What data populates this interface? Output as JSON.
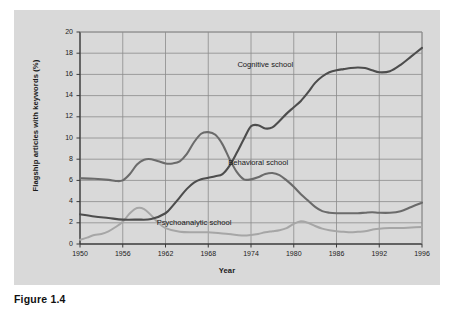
{
  "figure": {
    "caption": "Figure 1.4",
    "panel_bg": "#d9d9d9"
  },
  "chart_data": {
    "type": "line",
    "title": "",
    "xlabel": "Year",
    "ylabel": "Flagship articles with keywords (%)",
    "xlim": [
      1950,
      1996
    ],
    "ylim": [
      0,
      20
    ],
    "xticks": [
      1950,
      1956,
      1962,
      1968,
      1974,
      1980,
      1986,
      1992,
      1996
    ],
    "xtick_labels": [
      "1950",
      "1956",
      "1962",
      "1968",
      "1974",
      "1980",
      "1986",
      "1992",
      "1996"
    ],
    "yticks": [
      0,
      2,
      4,
      6,
      8,
      10,
      12,
      14,
      16,
      18,
      20
    ],
    "ytick_labels": [
      "0",
      "2",
      "4",
      "6",
      "8",
      "10",
      "12",
      "14",
      "16",
      "18",
      "20"
    ],
    "grid": true,
    "legend": "inline-annotations",
    "colors": {
      "cognitive": "#4d4d4d",
      "behavioral": "#6b6b6b",
      "psychoanalytic": "#a6a6a6",
      "axis": "#3a3a3a",
      "grid": "#8c8c8c"
    },
    "series": [
      {
        "name": "Cognitive school",
        "color": "#4d4d4d",
        "label_x": 1976,
        "label_y": 16.9,
        "x": [
          1950,
          1952,
          1954,
          1956,
          1958,
          1960,
          1962,
          1963,
          1964,
          1965,
          1966,
          1967,
          1968,
          1969,
          1970,
          1971,
          1972,
          1973,
          1974,
          1975,
          1976,
          1977,
          1978,
          1979,
          1980,
          1981,
          1982,
          1983,
          1984,
          1985,
          1986,
          1987,
          1988,
          1989,
          1990,
          1991,
          1992,
          1993,
          1994,
          1995,
          1996
        ],
        "y": [
          2.8,
          2.6,
          2.45,
          2.3,
          2.3,
          2.35,
          2.9,
          3.6,
          4.4,
          5.2,
          5.8,
          6.1,
          6.25,
          6.4,
          6.6,
          7.4,
          8.6,
          9.9,
          11.1,
          11.2,
          10.9,
          11.0,
          11.6,
          12.3,
          12.9,
          13.5,
          14.3,
          15.2,
          15.8,
          16.2,
          16.4,
          16.5,
          16.6,
          16.65,
          16.6,
          16.4,
          16.2,
          16.3,
          16.9,
          17.7,
          18.5
        ]
      },
      {
        "name": "Behavioral school",
        "color": "#6b6b6b",
        "label_x": 1975,
        "label_y": 7.6,
        "x": [
          1950,
          1952,
          1954,
          1955,
          1956,
          1957,
          1958,
          1959,
          1960,
          1961,
          1962,
          1963,
          1964,
          1965,
          1966,
          1967,
          1968,
          1969,
          1970,
          1971,
          1972,
          1973,
          1974,
          1975,
          1976,
          1977,
          1978,
          1979,
          1980,
          1981,
          1982,
          1983,
          1984,
          1985,
          1986,
          1987,
          1988,
          1989,
          1990,
          1991,
          1992,
          1993,
          1994,
          1995,
          1996
        ],
        "y": [
          6.2,
          6.15,
          6.05,
          5.95,
          6.0,
          6.6,
          7.5,
          7.95,
          8.0,
          7.8,
          7.6,
          7.6,
          7.8,
          8.5,
          9.6,
          10.4,
          10.55,
          10.3,
          9.4,
          8.0,
          6.8,
          6.1,
          6.1,
          6.3,
          6.6,
          6.7,
          6.5,
          6.0,
          5.4,
          4.7,
          4.1,
          3.5,
          3.1,
          2.95,
          2.9,
          2.9,
          2.9,
          2.9,
          2.95,
          3.0,
          2.95,
          2.95,
          3.1,
          3.5,
          3.9
        ]
      },
      {
        "name": "Psychoanalytic school",
        "color": "#a6a6a6",
        "label_x": 1966,
        "label_y": 2.0,
        "x": [
          1950,
          1951,
          1952,
          1953,
          1954,
          1955,
          1956,
          1957,
          1958,
          1959,
          1960,
          1961,
          1962,
          1964,
          1966,
          1968,
          1970,
          1972,
          1973,
          1974,
          1975,
          1976,
          1977,
          1978,
          1979,
          1980,
          1981,
          1982,
          1983,
          1984,
          1985,
          1986,
          1987,
          1988,
          1989,
          1990,
          1991,
          1992,
          1993,
          1994,
          1995,
          1996
        ],
        "y": [
          0.4,
          0.6,
          0.85,
          0.95,
          1.2,
          1.6,
          2.1,
          2.9,
          3.4,
          3.3,
          2.7,
          2.0,
          1.5,
          1.15,
          1.1,
          1.1,
          1.0,
          0.85,
          0.8,
          0.85,
          0.95,
          1.1,
          1.2,
          1.3,
          1.5,
          1.9,
          2.15,
          2.0,
          1.7,
          1.45,
          1.3,
          1.2,
          1.15,
          1.1,
          1.15,
          1.2,
          1.35,
          1.45,
          1.5,
          1.5,
          1.55,
          1.6
        ]
      }
    ]
  }
}
